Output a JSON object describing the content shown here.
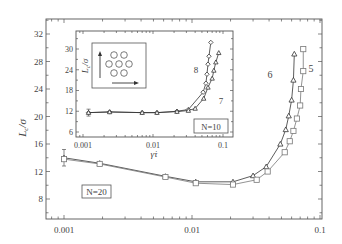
{
  "chart_data": [
    {
      "id": "main",
      "type": "line",
      "title": "",
      "xlabel": "",
      "ylabel": "L_c/σ",
      "xscale": "log",
      "xlim": [
        0.0007,
        0.105
      ],
      "ylim": [
        5,
        34
      ],
      "xticks": [
        0.001,
        0.01,
        0.1
      ],
      "xtick_labels": [
        "0.001",
        "0.01",
        "0.1"
      ],
      "yticks": [
        8,
        12,
        16,
        20,
        24,
        28,
        32
      ],
      "ytick_labels": [
        "8",
        "12",
        "16",
        "20",
        "24",
        "28",
        "32"
      ],
      "grid": false,
      "annotation_box": "N=20",
      "series": [
        {
          "name": "6",
          "marker": "triangle",
          "x": [
            0.001,
            0.0019,
            0.0062,
            0.0107,
            0.0209,
            0.03,
            0.038,
            0.049,
            0.054,
            0.057,
            0.06,
            0.062,
            0.063
          ],
          "y": [
            14.0,
            13.2,
            11.3,
            10.5,
            10.5,
            11.4,
            12.7,
            16.0,
            18.1,
            20.1,
            22.4,
            25.3,
            29.1
          ],
          "error_first": 1.2
        },
        {
          "name": "5",
          "marker": "square",
          "x": [
            0.001,
            0.0019,
            0.0062,
            0.0107,
            0.0209,
            0.032,
            0.039,
            0.053,
            0.058,
            0.062,
            0.066,
            0.07,
            0.071,
            0.074,
            0.074
          ],
          "y": [
            13.8,
            13.1,
            11.2,
            10.3,
            10.1,
            10.8,
            12.0,
            14.8,
            16.4,
            17.9,
            19.7,
            21.6,
            24.0,
            26.6,
            29.8
          ]
        }
      ]
    },
    {
      "id": "inset",
      "type": "line",
      "xlabel": "γ̇τ",
      "ylabel": "L_c/σ",
      "xscale": "log",
      "xlim": [
        0.0009,
        0.15
      ],
      "ylim": [
        5,
        35
      ],
      "xticks": [
        0.001,
        0.01,
        0.1
      ],
      "xtick_labels": [
        "0.001",
        "0.01",
        "0.1"
      ],
      "yticks": [
        6,
        12,
        18,
        24,
        30
      ],
      "ytick_labels": [
        "6",
        "12",
        "18",
        "24",
        "30"
      ],
      "annotation_box": "N=10",
      "series": [
        {
          "name": "8",
          "marker": "diamond",
          "x": [
            0.0012,
            0.0024,
            0.007,
            0.0114,
            0.022,
            0.032,
            0.052,
            0.057,
            0.059,
            0.061,
            0.063,
            0.067
          ],
          "y": [
            11.6,
            11.8,
            11.6,
            11.6,
            12.0,
            12.5,
            17.5,
            20.1,
            22.7,
            25.6,
            27.9,
            31.9
          ],
          "error_first": 1.0
        },
        {
          "name": "7",
          "marker": "triangle",
          "x": [
            0.0012,
            0.0024,
            0.007,
            0.0114,
            0.022,
            0.032,
            0.04,
            0.053,
            0.061,
            0.07,
            0.074,
            0.079,
            0.087
          ],
          "y": [
            11.6,
            11.8,
            11.6,
            11.6,
            11.9,
            12.2,
            12.8,
            15.7,
            18.9,
            21.5,
            23.8,
            26.2,
            28.9
          ]
        }
      ]
    }
  ],
  "labels": {
    "main_ylabel": "L",
    "main_ylabel_sub": "c",
    "main_ylabel_tail": "/σ",
    "inset_ylabel": "L",
    "inset_ylabel_sub": "c",
    "inset_ylabel_tail": "/σ",
    "inset_xlabel": "γ̇τ",
    "n20": "N=20",
    "n10": "N=10",
    "curve5": "5",
    "curve6": "6",
    "curve7": "7",
    "curve8": "8"
  }
}
